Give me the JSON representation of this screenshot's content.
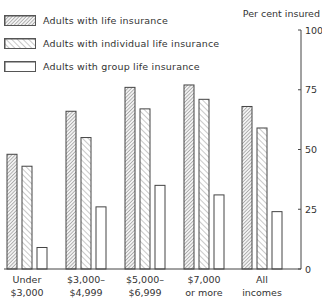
{
  "chart_data": {
    "type": "bar",
    "title": "",
    "xlabel": "",
    "ylabel": "Per cent insured",
    "ylim": [
      0,
      100
    ],
    "yticks": [
      0,
      25,
      50,
      75,
      100
    ],
    "grid": false,
    "legend_position": "top-left",
    "categories": [
      "Under $3,000",
      "$3,000-$4,999",
      "$5,000-$6,999",
      "$7,000 or more",
      "All incomes"
    ],
    "category_lines": [
      [
        "Under",
        "$3,000"
      ],
      [
        "$3,000–",
        "$4,999"
      ],
      [
        "$5,000–",
        "$6,999"
      ],
      [
        "$7,000",
        "or more"
      ],
      [
        "All",
        "incomes"
      ]
    ],
    "series": [
      {
        "name": "Adults with life insurance",
        "pattern": "dense-hatch",
        "values": [
          48,
          66,
          76,
          77,
          68
        ]
      },
      {
        "name": "Adults with individual life insurance",
        "pattern": "diagonal-hatch",
        "values": [
          43,
          55,
          67,
          71,
          59
        ]
      },
      {
        "name": "Adults with group life insurance",
        "pattern": "none",
        "values": [
          9,
          26,
          35,
          31,
          24
        ]
      }
    ]
  },
  "legend": {
    "items": [
      {
        "label": "Adults with life insurance"
      },
      {
        "label": "Adults with individual life insurance"
      },
      {
        "label": "Adults with group life insurance"
      }
    ]
  },
  "axis": {
    "title": "Per cent insured"
  }
}
